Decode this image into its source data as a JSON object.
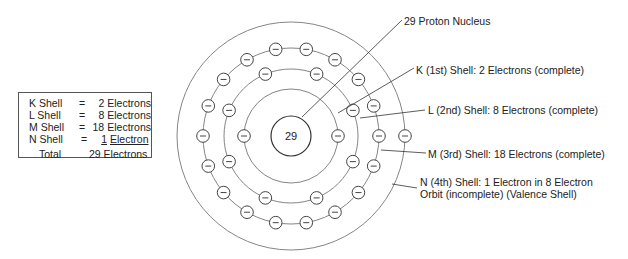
{
  "legend": {
    "rows": [
      {
        "shell": "K Shell",
        "eq": "=",
        "count": "2",
        "unit": "Electrons"
      },
      {
        "shell": "L Shell",
        "eq": "=",
        "count": "8",
        "unit": "Electrons"
      },
      {
        "shell": "M Shell",
        "eq": "=",
        "count": "18",
        "unit": "Electrons"
      },
      {
        "shell": "N Shell",
        "eq": "=",
        "count": "1",
        "unit": "Electron"
      }
    ],
    "total_label": "Total",
    "total_value": "29 Electrons"
  },
  "nucleus": {
    "label": "29"
  },
  "labels": {
    "nucleus": "29 Proton Nucleus",
    "k": "K (1st) Shell: 2 Electrons (complete)",
    "l": "L (2nd) Shell: 8 Electrons (complete)",
    "m": "M (3rd) Shell: 18 Electrons (complete)",
    "n1": "N (4th) Shell: 1 Electron in 8 Electron",
    "n2": "Orbit (incomplete) (Valence Shell)"
  },
  "colors": {
    "line": "#777777",
    "text": "#222222"
  }
}
